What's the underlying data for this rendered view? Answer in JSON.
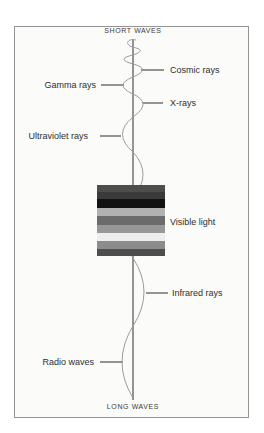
{
  "page": {
    "background": "#ffffff"
  },
  "frame": {
    "border_color": "#949494",
    "background": "#fbfbf9"
  },
  "diagram": {
    "title_top": "SHORT WAVES",
    "title_bottom": "LONG WAVES",
    "axis_color": "#3f3f3f",
    "wave_color": "#9c9c9c",
    "text_color": "#2e2e2e",
    "labels": [
      {
        "text": "Cosmic rays",
        "side": "right"
      },
      {
        "text": "Gamma rays",
        "side": "left"
      },
      {
        "text": "X-rays",
        "side": "right"
      },
      {
        "text": "Ultraviolet rays",
        "side": "left"
      },
      {
        "text": "Visible light",
        "side": "right"
      },
      {
        "text": "Infrared rays",
        "side": "right"
      },
      {
        "text": "Radio waves",
        "side": "left"
      }
    ],
    "visible_light_block": {
      "stripes": [
        {
          "color": "#4d4d4d",
          "height": 7
        },
        {
          "color": "#3a3a3a",
          "height": 7
        },
        {
          "color": "#121212",
          "height": 9
        },
        {
          "color": "#b1b1b1",
          "height": 8
        },
        {
          "color": "#6b6b6b",
          "height": 9
        },
        {
          "color": "#989898",
          "height": 8
        },
        {
          "color": "#eeeeee",
          "height": 8
        },
        {
          "color": "#8c8c8c",
          "height": 8
        },
        {
          "color": "#4d4d4d",
          "height": 7
        }
      ]
    }
  }
}
